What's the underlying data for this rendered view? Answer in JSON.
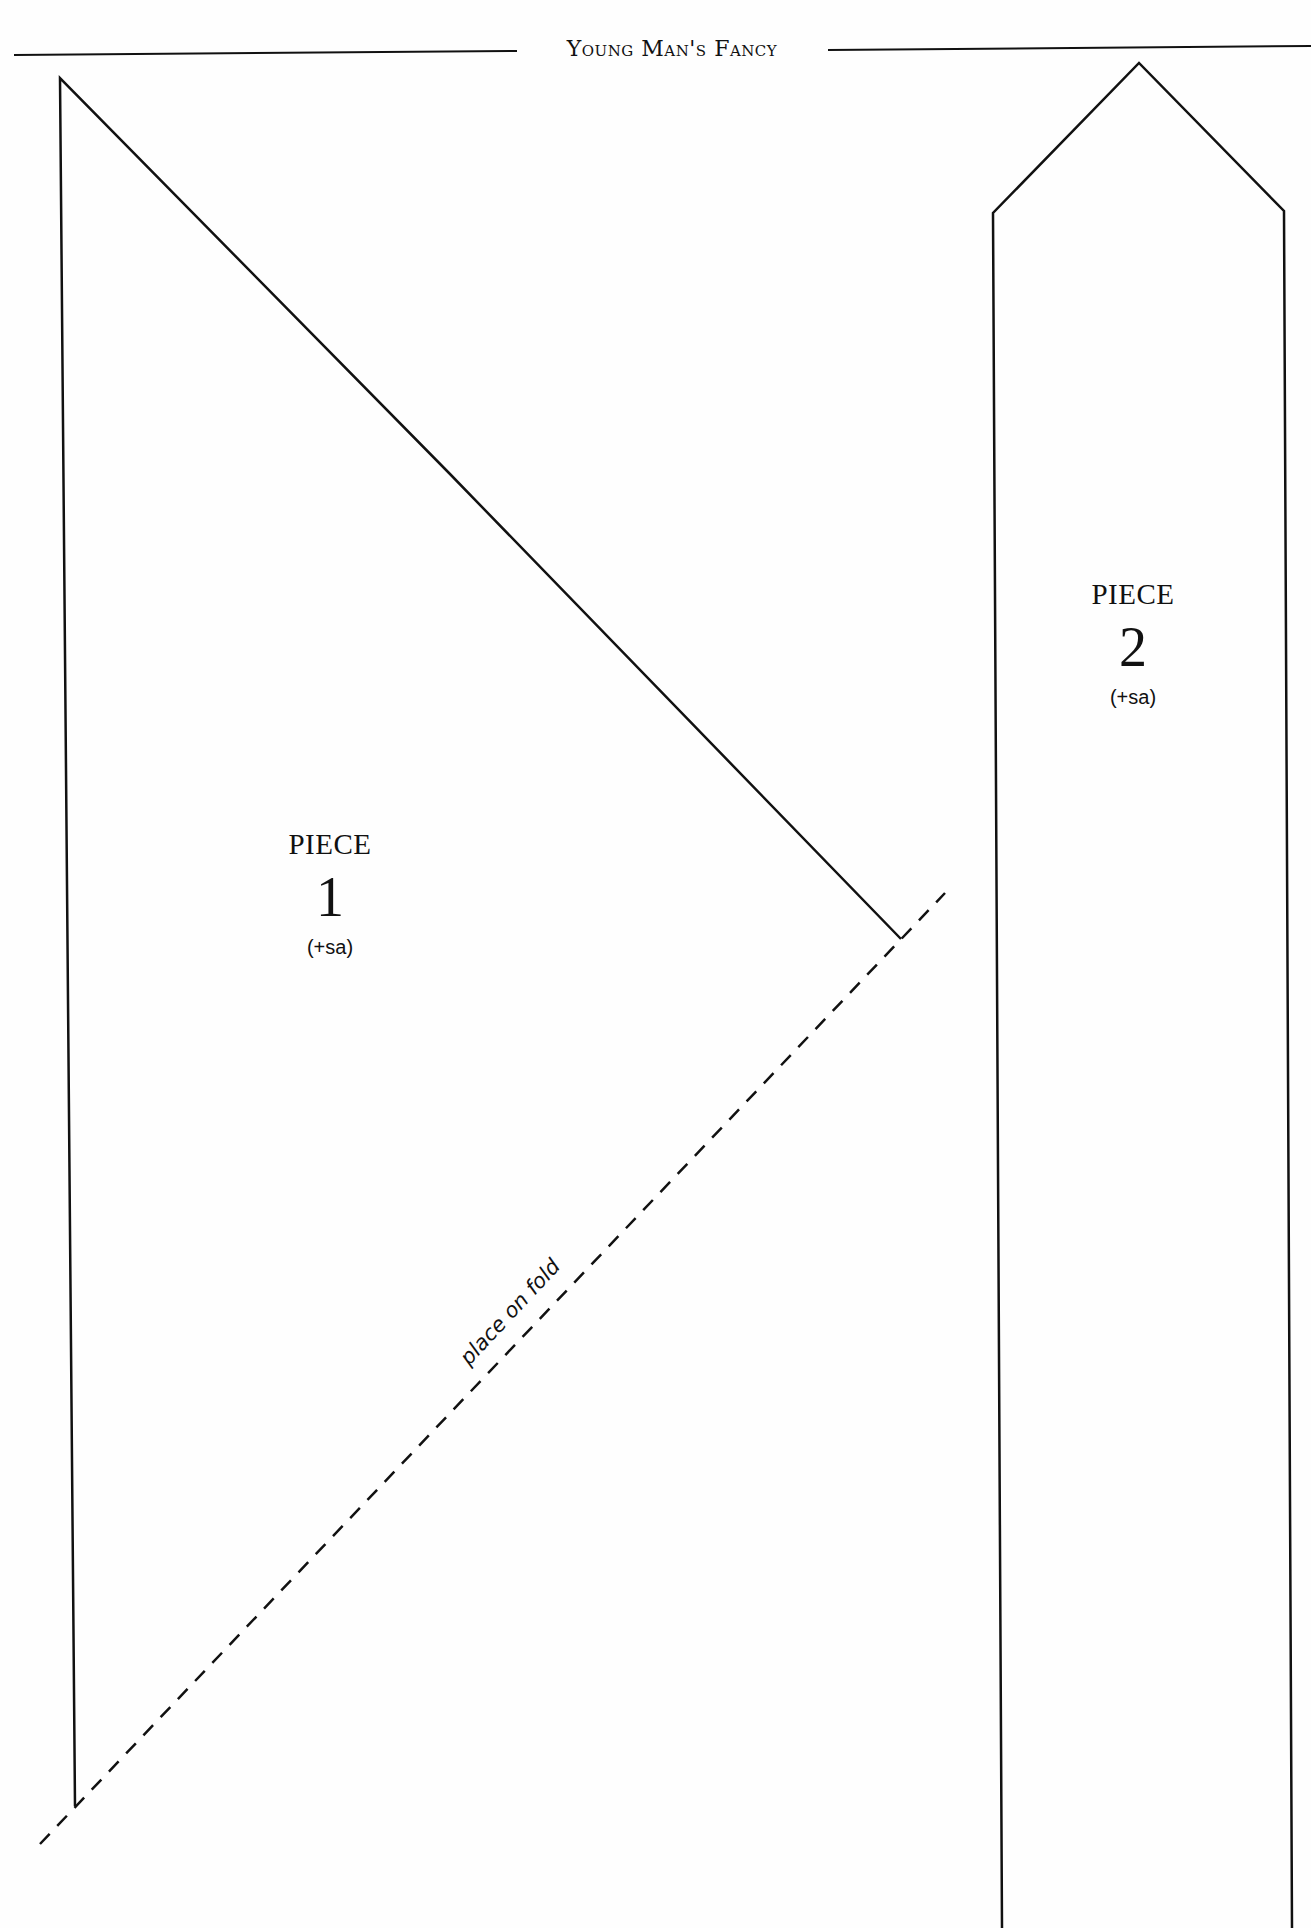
{
  "header": {
    "title": "Young Man's Fancy"
  },
  "pieces": [
    {
      "label": "PIECE",
      "number": "1",
      "note": "(+sa)"
    },
    {
      "label": "PIECE",
      "number": "2",
      "note": "(+sa)"
    }
  ],
  "fold_line": {
    "label": "place on fold"
  },
  "colors": {
    "ink": "#111111",
    "paper": "#fefefe"
  }
}
